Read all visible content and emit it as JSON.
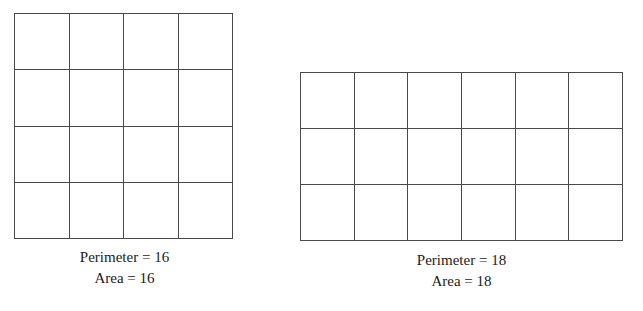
{
  "page": {
    "background_color": "#ffffff",
    "line_color": "#4a4a4a",
    "text_color": "#222222"
  },
  "figures": [
    {
      "id": "left",
      "shape": "square",
      "columns": 4,
      "rows": 3,
      "cell_count": 16,
      "perimeter_label": "Perimeter = 16",
      "area_label": "Area = 16",
      "perimeter_value": 16,
      "area_value": 16
    },
    {
      "id": "right",
      "shape": "rectangle",
      "columns": 6,
      "rows": 3,
      "cell_count": 18,
      "perimeter_label": "Perimeter = 18",
      "area_label": "Area = 18",
      "perimeter_value": 18,
      "area_value": 18
    }
  ],
  "chart_data": {
    "type": "table",
    "title": "",
    "xlabel": "",
    "ylabel": "",
    "categories": [
      "Square 4x4",
      "Rectangle 6x3"
    ],
    "series": [
      {
        "name": "Perimeter",
        "values": [
          16,
          18
        ]
      },
      {
        "name": "Area",
        "values": [
          16,
          18
        ]
      }
    ],
    "annotations": [
      "Perimeter = 16",
      "Area = 16",
      "Perimeter = 18",
      "Area = 18"
    ],
    "grid": true,
    "legend": "none"
  }
}
